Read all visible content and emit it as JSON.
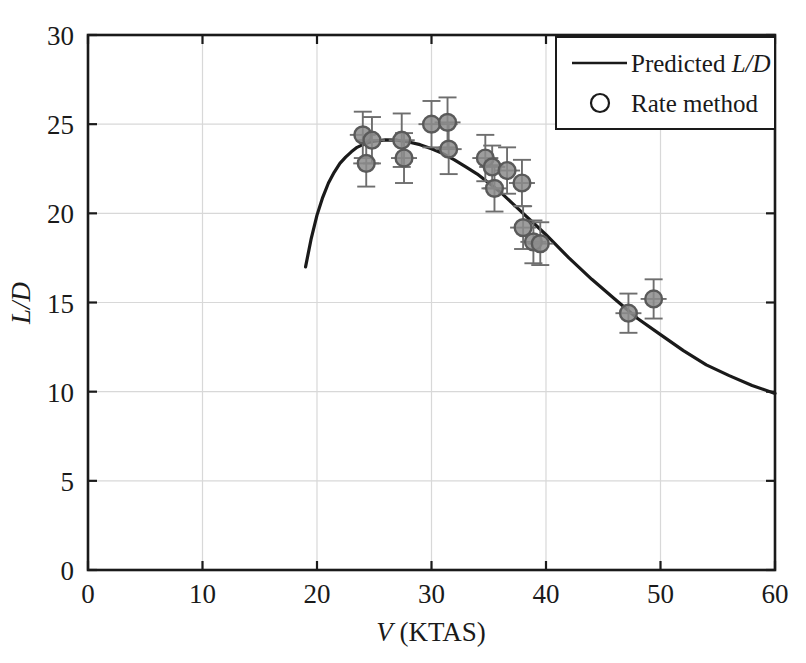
{
  "chart_data": {
    "type": "scatter",
    "title": "",
    "xlabel": "V (KTAS)",
    "ylabel": "L/D",
    "xlim": [
      0,
      60
    ],
    "ylim": [
      0,
      30
    ],
    "xticks": [
      "0",
      "10",
      "20",
      "30",
      "40",
      "50",
      "60"
    ],
    "yticks": [
      "0",
      "5",
      "10",
      "15",
      "20",
      "25",
      "30"
    ],
    "xtick_values": [
      0,
      10,
      20,
      30,
      40,
      50,
      60
    ],
    "ytick_values": [
      0,
      5,
      10,
      15,
      20,
      25,
      30
    ],
    "grid": true,
    "legend_position": "top-right",
    "series": [
      {
        "name": "Predicted L/D",
        "type": "line",
        "marker": "none",
        "color": "#1a1a1a",
        "points": [
          [
            19.0,
            17.0
          ],
          [
            19.5,
            18.6
          ],
          [
            20.0,
            19.9
          ],
          [
            20.5,
            20.9
          ],
          [
            21.0,
            21.7
          ],
          [
            21.5,
            22.3
          ],
          [
            22.0,
            22.8
          ],
          [
            22.5,
            23.15
          ],
          [
            23.0,
            23.45
          ],
          [
            23.5,
            23.7
          ],
          [
            24.0,
            23.85
          ],
          [
            24.5,
            23.97
          ],
          [
            25.0,
            24.05
          ],
          [
            26.0,
            24.12
          ],
          [
            27.0,
            24.1
          ],
          [
            28.0,
            24.0
          ],
          [
            29.0,
            23.85
          ],
          [
            30.0,
            23.62
          ],
          [
            31.0,
            23.35
          ],
          [
            32.0,
            23.0
          ],
          [
            33.0,
            22.6
          ],
          [
            34.0,
            22.2
          ],
          [
            35.0,
            21.7
          ],
          [
            36.0,
            21.2
          ],
          [
            37.0,
            20.6
          ],
          [
            38.0,
            20.0
          ],
          [
            39.0,
            19.4
          ],
          [
            40.0,
            18.8
          ],
          [
            42.0,
            17.5
          ],
          [
            44.0,
            16.3
          ],
          [
            46.0,
            15.2
          ],
          [
            48.0,
            14.1
          ],
          [
            50.0,
            13.2
          ],
          [
            52.0,
            12.3
          ],
          [
            54.0,
            11.5
          ],
          [
            56.0,
            10.9
          ],
          [
            58.0,
            10.35
          ],
          [
            60.0,
            9.9
          ]
        ]
      },
      {
        "name": "Rate method",
        "type": "scatter",
        "marker": "circle",
        "color": "#555555",
        "points": [
          {
            "x": 24.0,
            "y": 24.4,
            "yerr": 1.3
          },
          {
            "x": 24.3,
            "y": 22.8,
            "yerr": 1.3
          },
          {
            "x": 24.8,
            "y": 24.1,
            "yerr": 1.3
          },
          {
            "x": 27.4,
            "y": 24.1,
            "yerr": 1.5
          },
          {
            "x": 27.6,
            "y": 23.1,
            "yerr": 1.4
          },
          {
            "x": 30.0,
            "y": 25.0,
            "yerr": 1.3
          },
          {
            "x": 31.4,
            "y": 25.1,
            "yerr": 1.4
          },
          {
            "x": 31.5,
            "y": 23.6,
            "yerr": 1.4
          },
          {
            "x": 34.7,
            "y": 23.1,
            "yerr": 1.3
          },
          {
            "x": 35.3,
            "y": 22.6,
            "yerr": 1.2
          },
          {
            "x": 35.5,
            "y": 21.4,
            "yerr": 1.3
          },
          {
            "x": 36.6,
            "y": 22.4,
            "yerr": 1.3
          },
          {
            "x": 37.9,
            "y": 21.7,
            "yerr": 1.3
          },
          {
            "x": 38.0,
            "y": 19.2,
            "yerr": 1.2
          },
          {
            "x": 38.9,
            "y": 18.4,
            "yerr": 1.2
          },
          {
            "x": 39.5,
            "y": 18.3,
            "yerr": 1.2
          },
          {
            "x": 47.2,
            "y": 14.4,
            "yerr": 1.1
          },
          {
            "x": 49.4,
            "y": 15.2,
            "yerr": 1.1
          }
        ]
      }
    ],
    "legend": [
      {
        "label_prefix": "Predicted ",
        "label_italic": "L/D",
        "marker": "line"
      },
      {
        "label_prefix": "Rate method",
        "label_italic": "",
        "marker": "circle"
      }
    ]
  },
  "axes": {
    "x_label_plain": " (KTAS)",
    "x_label_italic": "V",
    "y_label_italic": "L/D"
  },
  "legend": {
    "entry1_prefix": "Predicted ",
    "entry1_italic": "L/D",
    "entry2_text": "Rate method"
  },
  "colors": {
    "axis": "#1a1a1a",
    "grid": "#d8d8d8",
    "line": "#1a1a1a",
    "marker_edge": "#5a5a5a",
    "marker_fill": "#8c8c8c",
    "errorbar": "#6e6e6e",
    "background": "#ffffff"
  }
}
